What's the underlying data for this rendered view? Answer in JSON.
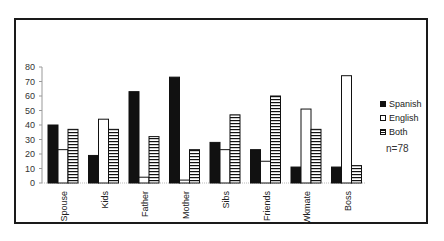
{
  "chart_data": {
    "type": "bar",
    "title": "",
    "xlabel": "",
    "ylabel": "",
    "ylim": [
      0,
      80
    ],
    "yticks": [
      0,
      10,
      20,
      30,
      40,
      50,
      60,
      70,
      80
    ],
    "grid": false,
    "legend_position": "right",
    "categories": [
      "Spouse",
      "Kids",
      "Father",
      "Mother",
      "Sibs",
      "Friends",
      "Wkmate",
      "Boss"
    ],
    "series": [
      {
        "name": "Spanish",
        "fill": "solid-black",
        "values": [
          40,
          19,
          63,
          73,
          28,
          23,
          11,
          11
        ]
      },
      {
        "name": "English",
        "fill": "white",
        "values": [
          23,
          44,
          4,
          2,
          23,
          15,
          51,
          74
        ]
      },
      {
        "name": "Both",
        "fill": "horizontal-stripes",
        "values": [
          37,
          37,
          32,
          23,
          47,
          60,
          37,
          12
        ]
      }
    ],
    "annotations": [
      "n=78"
    ]
  },
  "legend": {
    "items": [
      {
        "label": "Spanish"
      },
      {
        "label": "English"
      },
      {
        "label": "Both"
      }
    ]
  },
  "note": "n=78",
  "colors": {
    "bar_dark": "#111111",
    "bar_light": "#ffffff",
    "frame": "#1a1a1a"
  }
}
